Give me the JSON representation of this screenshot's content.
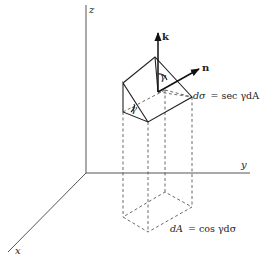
{
  "figure": {
    "axes": {
      "x_label": "x",
      "y_label": "y",
      "z_label": "z"
    },
    "vectors": {
      "k_label": "k",
      "n_label": "n"
    },
    "angles": {
      "top_gamma": "γ",
      "side_gamma": "γ"
    },
    "equations": {
      "surface_element_lhs": "dσ",
      "surface_element_rhs": "= sec γdA",
      "projected_element_lhs": "dA",
      "projected_element_rhs": "= cos γdσ"
    },
    "colors": {
      "ink": "#222222",
      "axis": "#555555",
      "background": "#ffffff"
    }
  }
}
